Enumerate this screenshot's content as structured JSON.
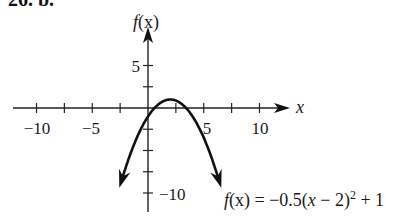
{
  "problem": {
    "label": "26. b."
  },
  "chart_data": {
    "type": "line",
    "title": "",
    "function": "f(x) = -0.5(x - 2)^2 + 1",
    "xlabel": "x",
    "ylabel": "f(x)",
    "x_tick_labels": [
      "-10",
      "-5",
      "5",
      "10"
    ],
    "y_tick_labels": [
      "5",
      "-10"
    ],
    "x_ticks": [
      -10,
      -7.5,
      -5,
      -2.5,
      2.5,
      5,
      7.5,
      10
    ],
    "y_ticks": [
      5,
      2.5,
      -2.5,
      -5,
      -7.5,
      -10
    ],
    "xlim": [
      -12,
      12
    ],
    "ylim": [
      -11.5,
      9
    ],
    "grid": false,
    "vertex": [
      2,
      1
    ],
    "series": [
      {
        "name": "f(x) = -0.5(x - 2)^2 + 1",
        "x": [
          -2.5,
          -2,
          -1,
          0,
          1,
          2,
          3,
          4,
          5,
          6,
          6.5
        ],
        "y": [
          -9.125,
          -7,
          -3.5,
          -1,
          0.5,
          1,
          0.5,
          -1,
          -3.5,
          -7,
          -9.125
        ]
      }
    ],
    "annotation": "f(x) = −0.5(x − 2)² + 1"
  },
  "labels": {
    "x_axis": "x",
    "y_axis_f": "f",
    "y_axis_x": "(x)",
    "tick_neg10": "−10",
    "tick_neg5": "−5",
    "tick_5": "5",
    "tick_10": "10",
    "ytick_5": "5",
    "ytick_neg10": "−10",
    "eq_f": "f",
    "eq_rest": "(x) = −0.5(",
    "eq_x": "x",
    "eq_minus2": " − 2)",
    "eq_sup": "2",
    "eq_plus1": " + 1"
  }
}
